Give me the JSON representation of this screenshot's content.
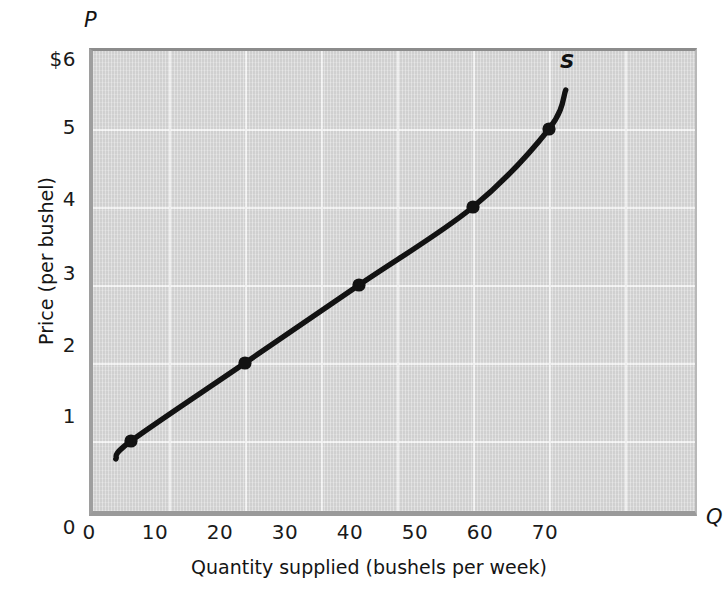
{
  "chart_data": {
    "type": "line",
    "title": "",
    "xlabel": "Quantity supplied (bushels per week)",
    "ylabel": "Price (per bushel)",
    "x_axis_letter": "Q",
    "y_axis_letter": "P",
    "series_label": "S",
    "series_name": "Supply curve",
    "xlim": [
      0,
      80
    ],
    "ylim": [
      0,
      6
    ],
    "xticks": [
      0,
      10,
      20,
      30,
      40,
      50,
      60,
      70
    ],
    "xtick_labels": [
      "0",
      "10",
      "20",
      "30",
      "40",
      "50",
      "60",
      "70"
    ],
    "yticks": [
      1,
      2,
      3,
      4,
      5,
      6
    ],
    "ytick_labels": [
      "1",
      "2",
      "3",
      "4",
      "5",
      "$6"
    ],
    "grid": true,
    "legend": "none",
    "x": [
      5,
      20,
      35,
      50,
      60
    ],
    "y": [
      1,
      2,
      3,
      4,
      5
    ],
    "points": [
      {
        "q": 5,
        "p": 1
      },
      {
        "q": 20,
        "p": 2
      },
      {
        "q": 35,
        "p": 3
      },
      {
        "q": 50,
        "p": 4
      },
      {
        "q": 60,
        "p": 5
      }
    ],
    "curve_start": {
      "q": 3.0,
      "p": 0.77
    },
    "curve_end": {
      "q": 62.2,
      "p": 5.5
    },
    "annotations": [
      {
        "text": "S",
        "q": 62.5,
        "p": 5.85
      }
    ]
  },
  "style": {
    "plot_background": "#d4d4d4",
    "grid_color": "#f2f2f2",
    "curve_color": "#121212",
    "text_color": "#141414",
    "page_background": "#ffffff",
    "axis_border_color": "#9e9e9e"
  },
  "ytick_labels_list": [
    "$6",
    "5",
    "4",
    "3",
    "2",
    "1",
    "0"
  ],
  "xtick_labels_list": [
    "0",
    "10",
    "20",
    "30",
    "40",
    "50",
    "60",
    "70"
  ]
}
